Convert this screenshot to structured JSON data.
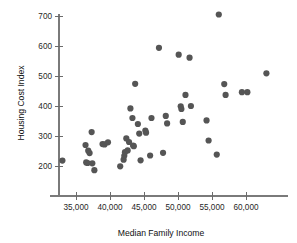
{
  "chart_data": {
    "type": "scatter",
    "title": "",
    "xlabel": "Median Family Income",
    "ylabel": "Housing Cost Index",
    "xlim": [
      32000,
      64500
    ],
    "ylim": [
      170,
      730
    ],
    "grid": false,
    "legend": null,
    "marker": {
      "color": "#555555",
      "size": 3.1,
      "shape": "circle"
    },
    "xticks": [
      35000,
      40000,
      45000,
      50000,
      55000,
      60000
    ],
    "xticklabels": [
      "35,000",
      "40,000",
      "45,000",
      "50,000",
      "55,000",
      "60,000"
    ],
    "yticks": [
      200,
      300,
      400,
      500,
      600,
      700
    ],
    "yticklabels": [
      "200",
      "300",
      "400",
      "500",
      "600",
      "700"
    ],
    "n_points": 51,
    "points": [
      {
        "x": 33000,
        "y": 218
      },
      {
        "x": 36400,
        "y": 270
      },
      {
        "x": 36500,
        "y": 212
      },
      {
        "x": 36700,
        "y": 210
      },
      {
        "x": 36800,
        "y": 251
      },
      {
        "x": 37000,
        "y": 243
      },
      {
        "x": 37300,
        "y": 313
      },
      {
        "x": 37400,
        "y": 209
      },
      {
        "x": 37700,
        "y": 186
      },
      {
        "x": 38900,
        "y": 273
      },
      {
        "x": 39200,
        "y": 272
      },
      {
        "x": 39700,
        "y": 279
      },
      {
        "x": 41500,
        "y": 199
      },
      {
        "x": 42000,
        "y": 221
      },
      {
        "x": 42100,
        "y": 234
      },
      {
        "x": 42200,
        "y": 246
      },
      {
        "x": 42400,
        "y": 292
      },
      {
        "x": 42600,
        "y": 252
      },
      {
        "x": 42800,
        "y": 280
      },
      {
        "x": 43000,
        "y": 392
      },
      {
        "x": 43300,
        "y": 360
      },
      {
        "x": 43400,
        "y": 268
      },
      {
        "x": 43500,
        "y": 266
      },
      {
        "x": 43700,
        "y": 474
      },
      {
        "x": 44100,
        "y": 340
      },
      {
        "x": 44300,
        "y": 308
      },
      {
        "x": 44500,
        "y": 219
      },
      {
        "x": 45200,
        "y": 318
      },
      {
        "x": 45300,
        "y": 311
      },
      {
        "x": 45900,
        "y": 235
      },
      {
        "x": 46100,
        "y": 360
      },
      {
        "x": 47200,
        "y": 594
      },
      {
        "x": 47800,
        "y": 244
      },
      {
        "x": 48200,
        "y": 367
      },
      {
        "x": 48400,
        "y": 342
      },
      {
        "x": 50100,
        "y": 571
      },
      {
        "x": 50400,
        "y": 399
      },
      {
        "x": 50500,
        "y": 390
      },
      {
        "x": 50700,
        "y": 347
      },
      {
        "x": 51100,
        "y": 437
      },
      {
        "x": 51700,
        "y": 561
      },
      {
        "x": 51900,
        "y": 400
      },
      {
        "x": 54200,
        "y": 352
      },
      {
        "x": 54500,
        "y": 285
      },
      {
        "x": 55700,
        "y": 238
      },
      {
        "x": 56000,
        "y": 705
      },
      {
        "x": 56800,
        "y": 473
      },
      {
        "x": 57000,
        "y": 437
      },
      {
        "x": 59400,
        "y": 446
      },
      {
        "x": 60200,
        "y": 446
      },
      {
        "x": 63000,
        "y": 509
      }
    ]
  }
}
